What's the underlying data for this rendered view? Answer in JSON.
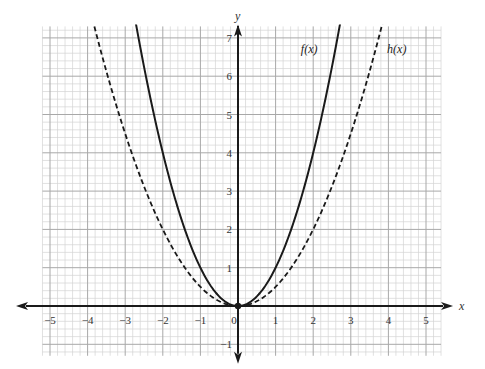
{
  "chart_data": {
    "type": "line",
    "title": "",
    "xlabel": "x",
    "ylabel": "y",
    "xlim": [
      -5.2,
      5.4
    ],
    "ylim": [
      -1.3,
      7.3
    ],
    "grid": true,
    "grid_minor_step": 0.2,
    "grid_major_step": 1,
    "x_ticks": [
      -5,
      -4,
      -3,
      -2,
      -1,
      0,
      1,
      2,
      3,
      4,
      5
    ],
    "x_tick_labels": [
      "−5",
      "−4",
      "−3",
      "−2",
      "−1",
      "0",
      "1",
      "2",
      "3",
      "4",
      "5"
    ],
    "y_ticks": [
      -1,
      1,
      2,
      3,
      4,
      5,
      6,
      7
    ],
    "y_tick_labels": [
      "−1",
      "1",
      "2",
      "3",
      "4",
      "5",
      "6",
      "7"
    ],
    "series": [
      {
        "name": "f(x)",
        "label": "f(x)",
        "style": "solid",
        "expression": "x^2",
        "coefficient": 1,
        "x": [
          -2.6,
          -2,
          -1.5,
          -1,
          -0.5,
          0,
          0.5,
          1,
          1.5,
          2,
          2.6
        ],
        "y": [
          6.76,
          4,
          2.25,
          1,
          0.25,
          0,
          0.25,
          1,
          2.25,
          4,
          6.76
        ],
        "label_position": "top, left of curve"
      },
      {
        "name": "h(x)",
        "label": "h(x)",
        "style": "dashed",
        "expression": "x^2/2",
        "coefficient": 0.5,
        "x": [
          -3.7,
          -3,
          -2,
          -1,
          0,
          1,
          2,
          3,
          3.7
        ],
        "y": [
          6.845,
          4.5,
          2,
          0.5,
          0,
          0.5,
          2,
          4.5,
          6.845
        ],
        "label_position": "top, right of curve"
      }
    ],
    "annotations": [
      {
        "type": "point",
        "x": 0,
        "y": 0,
        "label": ""
      }
    ],
    "colors": {
      "curve": "#1a1a1a",
      "axis": "#1a1a1a",
      "grid_minor": "#d4d4d4",
      "grid_major": "#a8a8a8"
    }
  }
}
